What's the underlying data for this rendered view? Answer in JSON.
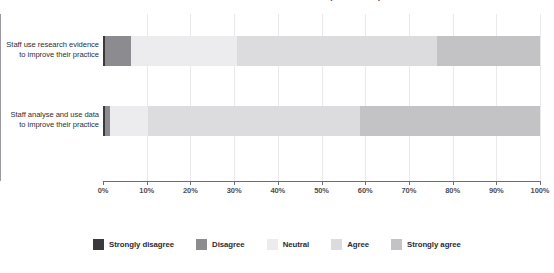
{
  "chart_data": {
    "type": "bar",
    "subtype": "stacked-horizontal-100pct",
    "title": "Staff use of research evidence and data to improve their practice",
    "categories": [
      "Staff use research evidence\nto improve their practice",
      "Staff analyse and use data\nto improve their practice"
    ],
    "series": [
      {
        "name": "Strongly disagree",
        "color": "#3a3a3e",
        "values": [
          0.5,
          0.5
        ]
      },
      {
        "name": "Disagree",
        "color": "#8b8b90",
        "values": [
          6.0,
          1.2
        ]
      },
      {
        "name": "Neutral",
        "color": "#ececee",
        "values": [
          24.2,
          8.6
        ]
      },
      {
        "name": "Agree",
        "color": "#dcdcde",
        "values": [
          45.7,
          48.5
        ]
      },
      {
        "name": "Strongly agree",
        "color": "#c3c3c6",
        "values": [
          23.6,
          41.2
        ]
      }
    ],
    "xlabel": "",
    "ylabel": "",
    "xlim": [
      0,
      100
    ],
    "xticks": [
      "0%",
      "10%",
      "20%",
      "30%",
      "40%",
      "50%",
      "60%",
      "70%",
      "80%",
      "90%",
      "100%"
    ],
    "xtick_values": [
      0,
      10,
      20,
      30,
      40,
      50,
      60,
      70,
      80,
      90,
      100
    ],
    "grid": "vertical",
    "legend_position": "bottom",
    "background_color": "#ffffff",
    "axis_color": "#6e6e76",
    "gridline_color": "#e9e9ec"
  },
  "axis": {
    "ticks": [
      {
        "label": "0%",
        "value": 0
      },
      {
        "label": "10%",
        "value": 10
      },
      {
        "label": "20%",
        "value": 20
      },
      {
        "label": "30%",
        "value": 30
      },
      {
        "label": "40%",
        "value": 40
      },
      {
        "label": "50%",
        "value": 50
      },
      {
        "label": "60%",
        "value": 60
      },
      {
        "label": "70%",
        "value": 70
      },
      {
        "label": "80%",
        "value": 80
      },
      {
        "label": "90%",
        "value": 90
      },
      {
        "label": "100%",
        "value": 100
      }
    ]
  },
  "categories_display": [
    {
      "line1": "Staff use research evidence",
      "line2": "to improve their practice"
    },
    {
      "line1": "Staff analyse and use data",
      "line2": "to improve their practice"
    }
  ],
  "legend": {
    "items": [
      {
        "label": "Strongly disagree",
        "color": "#3a3a3e"
      },
      {
        "label": "Disagree",
        "color": "#8b8b90"
      },
      {
        "label": "Neutral",
        "color": "#ececee"
      },
      {
        "label": "Agree",
        "color": "#dcdcde"
      },
      {
        "label": "Strongly agree",
        "color": "#c3c3c6"
      }
    ]
  }
}
